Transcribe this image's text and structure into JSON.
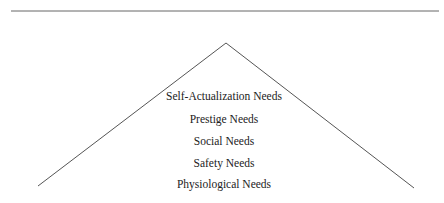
{
  "diagram": {
    "type": "pyramid",
    "levels_top_to_bottom": [
      "Self-Actualization Needs",
      "Prestige Needs",
      "Social Needs",
      "Safety Needs",
      "Physiological Needs"
    ],
    "colors": {
      "line": "#555555",
      "text": "#222222",
      "background": "#ffffff"
    }
  }
}
